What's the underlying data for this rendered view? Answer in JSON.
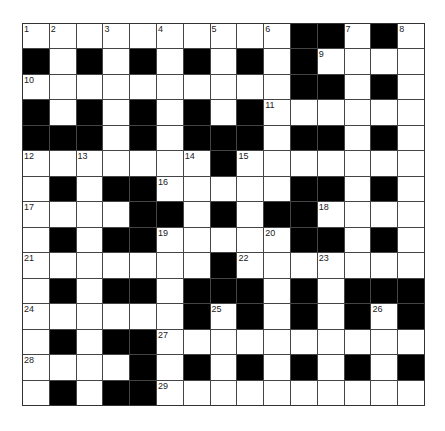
{
  "puzzle": {
    "type": "crossword",
    "size": {
      "rows": 15,
      "cols": 15
    },
    "colors": {
      "block": "#000000",
      "cell": "#ffffff",
      "grid_line": "#444444"
    },
    "layout": [
      "WWWWWWWWWWBBWBW",
      "BWBWBWBWBWBWWWW",
      "WWWWWWWWWWBBWBW",
      "BWBWBWBWBWWWWWW",
      "BBBWBWBBBWBBWBW",
      "WWWWWWWBWWWWWWW",
      "WBWBBWWWWWBBWBW",
      "WWWWBBWBWBBWWWW",
      "WBWBBWWWWWBBWBW",
      "WWWWWWWBWWWWWWW",
      "WBWBBWBBBWBWBBB",
      "WWWWWWBWBWBWBWB",
      "WBWBBWWWWWWWWWW",
      "WWWWBWBWBWBWBWB",
      "WBWBBWWWWWWWWWW"
    ],
    "numbers": [
      {
        "n": "1",
        "r": 0,
        "c": 0
      },
      {
        "n": "2",
        "r": 0,
        "c": 1
      },
      {
        "n": "3",
        "r": 0,
        "c": 3
      },
      {
        "n": "4",
        "r": 0,
        "c": 5
      },
      {
        "n": "5",
        "r": 0,
        "c": 7
      },
      {
        "n": "6",
        "r": 0,
        "c": 9
      },
      {
        "n": "7",
        "r": 0,
        "c": 12
      },
      {
        "n": "8",
        "r": 0,
        "c": 14
      },
      {
        "n": "9",
        "r": 1,
        "c": 11
      },
      {
        "n": "10",
        "r": 2,
        "c": 0
      },
      {
        "n": "11",
        "r": 3,
        "c": 9
      },
      {
        "n": "12",
        "r": 5,
        "c": 0
      },
      {
        "n": "13",
        "r": 5,
        "c": 2
      },
      {
        "n": "14",
        "r": 5,
        "c": 6
      },
      {
        "n": "15",
        "r": 5,
        "c": 8
      },
      {
        "n": "16",
        "r": 6,
        "c": 5
      },
      {
        "n": "17",
        "r": 7,
        "c": 0
      },
      {
        "n": "18",
        "r": 7,
        "c": 11
      },
      {
        "n": "19",
        "r": 8,
        "c": 5
      },
      {
        "n": "20",
        "r": 8,
        "c": 9
      },
      {
        "n": "21",
        "r": 9,
        "c": 0
      },
      {
        "n": "22",
        "r": 9,
        "c": 8
      },
      {
        "n": "23",
        "r": 9,
        "c": 11
      },
      {
        "n": "24",
        "r": 11,
        "c": 0
      },
      {
        "n": "25",
        "r": 11,
        "c": 7
      },
      {
        "n": "26",
        "r": 11,
        "c": 13
      },
      {
        "n": "27",
        "r": 12,
        "c": 5
      },
      {
        "n": "28",
        "r": 13,
        "c": 0
      },
      {
        "n": "29",
        "r": 14,
        "c": 5
      }
    ]
  }
}
